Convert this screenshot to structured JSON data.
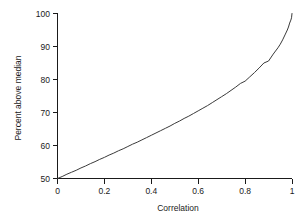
{
  "chart_data": {
    "type": "line",
    "title": "",
    "subtitle": "",
    "xlabel": "Correlation",
    "ylabel": "Percent above median",
    "xlim": [
      0,
      1
    ],
    "ylim": [
      50,
      100
    ],
    "grid": false,
    "legend": null,
    "legend_position": "none",
    "xticks": [
      0,
      0.2,
      0.4,
      0.6,
      0.8,
      1
    ],
    "xtick_labels": [
      "0",
      "0.2",
      "0.4",
      "0.6",
      "0.8",
      "1"
    ],
    "yticks": [
      50,
      60,
      70,
      80,
      90,
      100
    ],
    "ytick_labels": [
      "50",
      "60",
      "70",
      "80",
      "90",
      "100"
    ],
    "series": [
      {
        "name": "percent above median",
        "color": "#3a3a3a",
        "x": [
          0,
          0.02,
          0.04,
          0.06,
          0.08,
          0.1,
          0.12,
          0.14,
          0.16,
          0.18,
          0.2,
          0.22,
          0.24,
          0.26,
          0.28,
          0.3,
          0.32,
          0.34,
          0.36,
          0.38,
          0.4,
          0.42,
          0.44,
          0.46,
          0.48,
          0.5,
          0.52,
          0.54,
          0.56,
          0.58,
          0.6,
          0.62,
          0.64,
          0.66,
          0.68,
          0.7,
          0.72,
          0.74,
          0.76,
          0.78,
          0.8,
          0.82,
          0.84,
          0.86,
          0.88,
          0.9,
          0.92,
          0.94,
          0.95,
          0.96,
          0.97,
          0.98,
          0.985,
          0.99,
          0.995,
          0.998,
          1
        ],
        "y": [
          50.0,
          50.6,
          51.3,
          51.9,
          52.5,
          53.2,
          53.8,
          54.5,
          55.1,
          55.8,
          56.4,
          57.1,
          57.7,
          58.4,
          59.0,
          59.7,
          60.4,
          61.0,
          61.7,
          62.4,
          63.1,
          63.8,
          64.5,
          65.2,
          65.9,
          66.7,
          67.4,
          68.2,
          68.9,
          69.7,
          70.5,
          71.3,
          72.1,
          73.0,
          73.9,
          74.8,
          75.7,
          76.7,
          77.7,
          78.8,
          79.5,
          80.8,
          82.1,
          83.5,
          85.0,
          85.6,
          87.7,
          89.6,
          90.7,
          92.0,
          93.5,
          95.0,
          95.9,
          97.1,
          98.0,
          98.7,
          100.0
        ]
      }
    ],
    "equation_note": ""
  }
}
